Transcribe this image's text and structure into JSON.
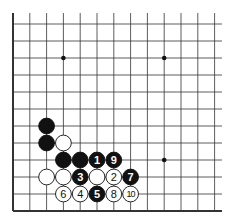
{
  "diagram": {
    "type": "go-board-fragment",
    "colors": {
      "line": "#333333",
      "black": "#111111",
      "white": "#ffffff",
      "background": "#ffffff"
    },
    "grid": {
      "x0": 13,
      "dx": 16.8,
      "cols": 13,
      "y_bottom": 211,
      "dy": 17,
      "rows": 12,
      "top_extend": 13,
      "right_extend": 222
    },
    "star_points": [
      [
        3,
        9
      ],
      [
        9,
        9
      ],
      [
        9,
        3
      ]
    ],
    "stones": [
      {
        "col": 2,
        "row": 5,
        "color": "black",
        "label": ""
      },
      {
        "col": 2,
        "row": 4,
        "color": "black",
        "label": ""
      },
      {
        "col": 3,
        "row": 4,
        "color": "white",
        "label": ""
      },
      {
        "col": 3,
        "row": 3,
        "color": "black",
        "label": ""
      },
      {
        "col": 4,
        "row": 3,
        "color": "black",
        "label": ""
      },
      {
        "col": 5,
        "row": 3,
        "color": "black",
        "label": "1"
      },
      {
        "col": 6,
        "row": 3,
        "color": "black",
        "label": "9"
      },
      {
        "col": 2,
        "row": 2,
        "color": "white",
        "label": ""
      },
      {
        "col": 3,
        "row": 2,
        "color": "white",
        "label": ""
      },
      {
        "col": 4,
        "row": 2,
        "color": "black",
        "label": "3"
      },
      {
        "col": 5,
        "row": 2,
        "color": "white",
        "label": ""
      },
      {
        "col": 6,
        "row": 2,
        "color": "white",
        "label": "2"
      },
      {
        "col": 7,
        "row": 2,
        "color": "black",
        "label": "7"
      },
      {
        "col": 3,
        "row": 1,
        "color": "white",
        "label": "6"
      },
      {
        "col": 4,
        "row": 1,
        "color": "white",
        "label": "4"
      },
      {
        "col": 5,
        "row": 1,
        "color": "black",
        "label": "5"
      },
      {
        "col": 6,
        "row": 1,
        "color": "white",
        "label": "8"
      },
      {
        "col": 7,
        "row": 1,
        "color": "white",
        "label": "10"
      }
    ]
  }
}
